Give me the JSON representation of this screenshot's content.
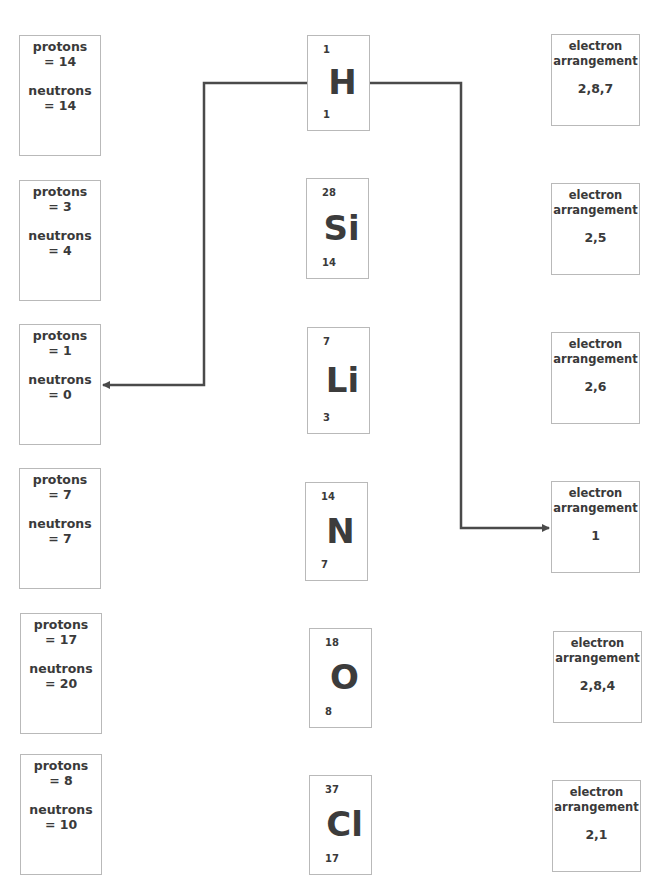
{
  "left_column": [
    {
      "protons_label": "protons",
      "protons_value": "= 14",
      "neutrons_label": "neutrons",
      "neutrons_value": "= 14"
    },
    {
      "protons_label": "protons",
      "protons_value": "= 3",
      "neutrons_label": "neutrons",
      "neutrons_value": "= 4"
    },
    {
      "protons_label": "protons",
      "protons_value": "= 1",
      "neutrons_label": "neutrons",
      "neutrons_value": "= 0"
    },
    {
      "protons_label": "protons",
      "protons_value": "= 7",
      "neutrons_label": "neutrons",
      "neutrons_value": "= 7"
    },
    {
      "protons_label": "protons",
      "protons_value": "= 17",
      "neutrons_label": "neutrons",
      "neutrons_value": "= 20"
    },
    {
      "protons_label": "protons",
      "protons_value": "= 8",
      "neutrons_label": "neutrons",
      "neutrons_value": "= 10"
    }
  ],
  "middle_column": [
    {
      "mass_number": "1",
      "symbol": "H",
      "atomic_number": "1"
    },
    {
      "mass_number": "28",
      "symbol": "Si",
      "atomic_number": "14"
    },
    {
      "mass_number": "7",
      "symbol": "Li",
      "atomic_number": "3"
    },
    {
      "mass_number": "14",
      "symbol": "N",
      "atomic_number": "7"
    },
    {
      "mass_number": "18",
      "symbol": "O",
      "atomic_number": "8"
    },
    {
      "mass_number": "37",
      "symbol": "Cl",
      "atomic_number": "17"
    }
  ],
  "right_column": [
    {
      "label_line1": "electron",
      "label_line2": "arrangement",
      "value": "2,8,7"
    },
    {
      "label_line1": "electron",
      "label_line2": "arrangement",
      "value": "2,5"
    },
    {
      "label_line1": "electron",
      "label_line2": "arrangement",
      "value": "2,6"
    },
    {
      "label_line1": "electron",
      "label_line2": "arrangement",
      "value": "1"
    },
    {
      "label_line1": "electron",
      "label_line2": "arrangement",
      "value": "2,8,4"
    },
    {
      "label_line1": "electron",
      "label_line2": "arrangement",
      "value": "2,1"
    }
  ],
  "connectors": [
    {
      "from": "H",
      "to": "protons = 1, neutrons = 0"
    },
    {
      "from": "H",
      "to": "electron arrangement 1"
    }
  ],
  "colors": {
    "line": "#4a4a4a",
    "border": "#b9b9b9",
    "text": "#3a3a3a"
  }
}
